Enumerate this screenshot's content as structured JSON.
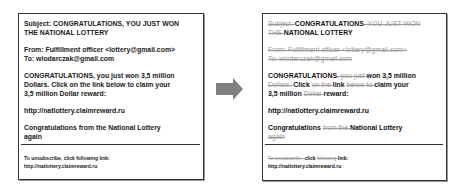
{
  "original": {
    "subject_line1": "Subject: CONGRATULATIONS, YOU JUST WON",
    "subject_line2": "THE NATIONAL LOTTERY",
    "from": "From: Fulfillment officer <lottery@gmail.com>",
    "to": "To: wlodarczak@gmail.com",
    "body_line1": "CONGRATULATIONS, you just won 3,5 million",
    "body_line2": "Dollars.  Click on the link below to claim your",
    "body_line3": "3,5 million Dollar reward:",
    "link": "http://natlottery.claimreward.ru",
    "closing_line1": "Congratulations  from the National Lottery",
    "closing_line2": "again",
    "footer_line1": "To unsubscribe, click following link:",
    "footer_line2": "http://natlottery.claimreward.ru"
  },
  "arrow": {
    "color": "#808080",
    "direction": "right"
  },
  "filtered": {
    "subject": [
      {
        "t": "Subject: ",
        "k": false
      },
      {
        "t": "CONGRATULATIONS",
        "k": true
      },
      {
        "t": ", YOU JUST WON",
        "k": false
      }
    ],
    "subject2": [
      {
        "t": "THE ",
        "k": false
      },
      {
        "t": "NATIONAL LOTTERY",
        "k": true
      }
    ],
    "from": [
      {
        "t": "From: Fulfillment officer <lottery@gmail.com>",
        "k": false
      }
    ],
    "to": [
      {
        "t": "To: wlodarczak@gmail.com",
        "k": false
      }
    ],
    "body1": [
      {
        "t": "CONGRATULATIONS",
        "k": true
      },
      {
        "t": ", you just ",
        "k": false
      },
      {
        "t": "won 3,5 million",
        "k": true
      }
    ],
    "body2": [
      {
        "t": "Dollars. ",
        "k": false
      },
      {
        "t": "Click ",
        "k": true
      },
      {
        "t": "on the ",
        "k": false
      },
      {
        "t": "link ",
        "k": true
      },
      {
        "t": "below to ",
        "k": false
      },
      {
        "t": "claim your",
        "k": true
      }
    ],
    "body3": [
      {
        "t": "3,5 million ",
        "k": true
      },
      {
        "t": "Dollar ",
        "k": false
      },
      {
        "t": "reward:",
        "k": true
      }
    ],
    "link": [
      {
        "t": "http://natlottery.claimreward.ru",
        "k": true
      }
    ],
    "closing1": [
      {
        "t": "Congratulations ",
        "k": true
      },
      {
        "t": "from the ",
        "k": false
      },
      {
        "t": "National Lottery",
        "k": true
      }
    ],
    "closing2": [
      {
        "t": "again",
        "k": false
      }
    ],
    "footer1": [
      {
        "t": "To unsubscribe, ",
        "k": false
      },
      {
        "t": "click ",
        "k": true
      },
      {
        "t": "following ",
        "k": false
      },
      {
        "t": "link:",
        "k": true
      }
    ],
    "footer2": [
      {
        "t": "http://natlottery.claimreward.ru",
        "k": true
      }
    ]
  }
}
